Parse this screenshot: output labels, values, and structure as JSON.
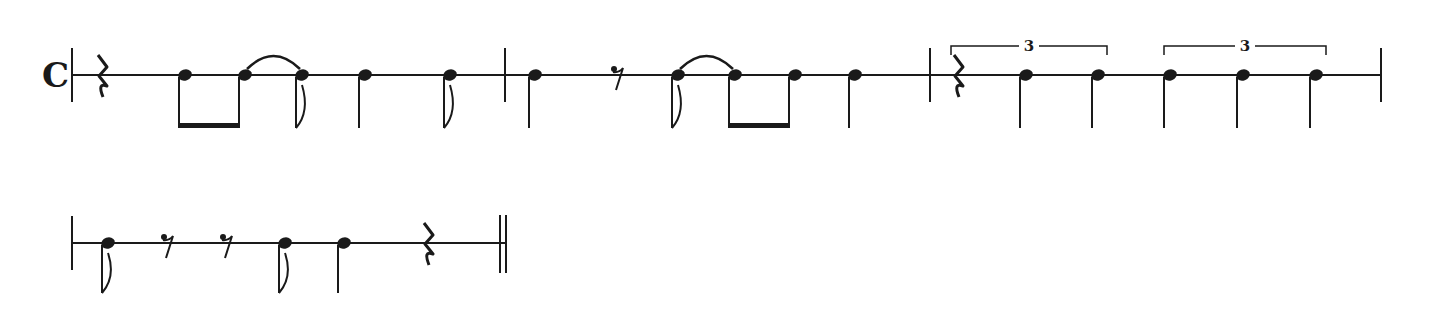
{
  "score": {
    "time_signature": "C",
    "ink_color": "#1a1a1a",
    "background": "#ffffff",
    "systems": [
      {
        "line_y": 75,
        "x_start": 72,
        "x_end": 1381,
        "measures": [
          {
            "index": 1,
            "events": [
              {
                "type": "quarter-rest",
                "x": 102
              },
              {
                "type": "eighth",
                "x": 185,
                "beam_group": "m1b1"
              },
              {
                "type": "eighth",
                "x": 245,
                "beam_group": "m1b1",
                "tie_to_next": true
              },
              {
                "type": "eighth",
                "x": 302,
                "flag": true
              },
              {
                "type": "quarter",
                "x": 365
              },
              {
                "type": "eighth",
                "x": 450,
                "flag": true
              }
            ]
          },
          {
            "index": 2,
            "events": [
              {
                "type": "quarter",
                "x": 535
              },
              {
                "type": "eighth-rest",
                "x": 618
              },
              {
                "type": "eighth",
                "x": 678,
                "flag": true,
                "tie_to_next": true
              },
              {
                "type": "eighth",
                "x": 735,
                "beam_group": "m2b1"
              },
              {
                "type": "eighth",
                "x": 795,
                "beam_group": "m2b1"
              },
              {
                "type": "quarter",
                "x": 855
              }
            ]
          },
          {
            "index": 3,
            "tuplets": [
              {
                "label": "3",
                "x1": 951,
                "x2": 1107
              },
              {
                "label": "3",
                "x1": 1164,
                "x2": 1326
              }
            ],
            "events": [
              {
                "type": "quarter-rest",
                "x": 958
              },
              {
                "type": "quarter",
                "x": 1026
              },
              {
                "type": "quarter",
                "x": 1098
              },
              {
                "type": "quarter",
                "x": 1170
              },
              {
                "type": "quarter",
                "x": 1243
              },
              {
                "type": "quarter",
                "x": 1316
              }
            ]
          }
        ],
        "barlines": [
          505,
          930,
          1381
        ]
      },
      {
        "line_y": 243,
        "x_start": 72,
        "x_end": 505,
        "measures": [
          {
            "index": 4,
            "events": [
              {
                "type": "eighth",
                "x": 108,
                "flag": true
              },
              {
                "type": "eighth-rest",
                "x": 168
              },
              {
                "type": "eighth-rest",
                "x": 227
              },
              {
                "type": "eighth",
                "x": 285,
                "flag": true
              },
              {
                "type": "quarter",
                "x": 344
              },
              {
                "type": "quarter-rest",
                "x": 428
              }
            ]
          }
        ],
        "final_barline": {
          "type": "double",
          "x": 500
        }
      }
    ]
  }
}
